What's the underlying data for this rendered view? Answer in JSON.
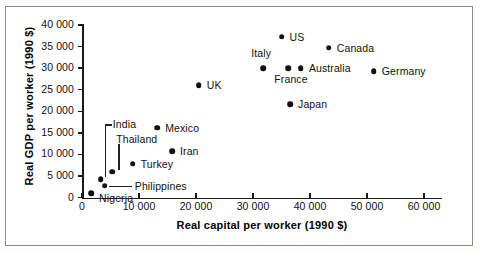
{
  "chart_data": {
    "type": "scatter",
    "title": "",
    "xlabel": "Real capital per worker (1990 $)",
    "ylabel": "Real GDP per worker (1990 $)",
    "xlim": [
      0,
      63000
    ],
    "ylim": [
      0,
      40000
    ],
    "xticks": [
      "0",
      "10 000",
      "20 000",
      "30 000",
      "40 000",
      "50 000",
      "60 000"
    ],
    "xtick_values": [
      0,
      10000,
      20000,
      30000,
      40000,
      50000,
      60000
    ],
    "yticks": [
      "0",
      "5 000",
      "10 000",
      "15 000",
      "20 000",
      "25 000",
      "30 000",
      "35 000",
      "40 000"
    ],
    "ytick_values": [
      0,
      5000,
      10000,
      15000,
      20000,
      25000,
      30000,
      35000,
      40000
    ],
    "grid": false,
    "legend": "none",
    "points": [
      {
        "name": "Nigeria",
        "x": 1600,
        "y": 1000,
        "label_dx": 8,
        "label_dy": 6,
        "leader": "none"
      },
      {
        "name": "India",
        "x": 3300,
        "y": 4200,
        "label_dx": 12,
        "label_dy": -54,
        "leader": "elbow"
      },
      {
        "name": "Philippines",
        "x": 4000,
        "y": 2800,
        "label_dx": 30,
        "label_dy": 1,
        "leader": "horizontal"
      },
      {
        "name": "Thailand",
        "x": 5300,
        "y": 6000,
        "label_dx": 4,
        "label_dy": -32,
        "leader": "vertical"
      },
      {
        "name": "Turkey",
        "x": 8900,
        "y": 7900,
        "label_dx": 8,
        "label_dy": 1,
        "leader": "none"
      },
      {
        "name": "Mexico",
        "x": 13200,
        "y": 16200,
        "label_dx": 8,
        "label_dy": 1,
        "leader": "none"
      },
      {
        "name": "Iran",
        "x": 15800,
        "y": 10700,
        "label_dx": 8,
        "label_dy": 1,
        "leader": "none"
      },
      {
        "name": "UK",
        "x": 20500,
        "y": 26000,
        "label_dx": 8,
        "label_dy": 1,
        "leader": "none"
      },
      {
        "name": "Italy",
        "x": 31800,
        "y": 30000,
        "label_dx": -12,
        "label_dy": -14,
        "leader": "none"
      },
      {
        "name": "US",
        "x": 35000,
        "y": 37300,
        "label_dx": 8,
        "label_dy": 1,
        "leader": "none"
      },
      {
        "name": "France",
        "x": 36200,
        "y": 30000,
        "label_dx": -14,
        "label_dy": 12,
        "leader": "none"
      },
      {
        "name": "Japan",
        "x": 36500,
        "y": 21600,
        "label_dx": 8,
        "label_dy": 1,
        "leader": "none"
      },
      {
        "name": "Australia",
        "x": 38400,
        "y": 30000,
        "label_dx": 8,
        "label_dy": 1,
        "leader": "none"
      },
      {
        "name": "Canada",
        "x": 43300,
        "y": 34700,
        "label_dx": 8,
        "label_dy": 1,
        "leader": "none"
      },
      {
        "name": "Germany",
        "x": 51200,
        "y": 29300,
        "label_dx": 8,
        "label_dy": 1,
        "leader": "none"
      }
    ]
  }
}
